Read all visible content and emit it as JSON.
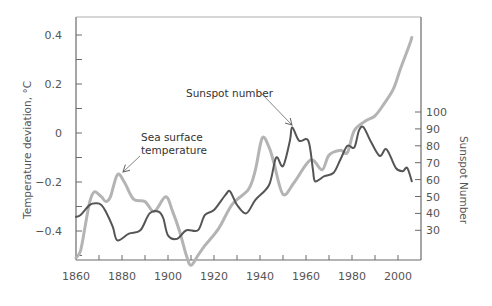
{
  "chart_data": {
    "type": "line",
    "title": "",
    "xlabel": "",
    "ylabel": "Temperature deviation, °C",
    "y2label": "Sunspot Number",
    "xlim": [
      1860,
      2010
    ],
    "ylim": [
      -0.52,
      0.46
    ],
    "y2lim": [
      17,
      123
    ],
    "x_ticks": [
      1860,
      1880,
      1900,
      1920,
      1940,
      1960,
      1980,
      2000
    ],
    "x_minor_ticks": [
      1870,
      1890,
      1910,
      1930,
      1950,
      1970,
      1990
    ],
    "y_ticks": [
      {
        "value": 0.4,
        "label": "0.4"
      },
      {
        "value": 0.2,
        "label": "0.2"
      },
      {
        "value": 0,
        "label": "0"
      },
      {
        "value": -0.2,
        "label": "-0.2"
      },
      {
        "value": -0.4,
        "label": "-0.4"
      }
    ],
    "y_minor_ticks": [
      0.3,
      0.1,
      -0.1,
      -0.3,
      -0.5
    ],
    "y2_ticks": [
      100,
      90,
      80,
      70,
      60,
      50,
      40,
      30
    ],
    "grid": false,
    "legend": "annotations",
    "series": [
      {
        "name": "Sea surface temperature",
        "axis": "left",
        "color": "#b4b4b4",
        "width": 3,
        "x": [
          1860,
          1862,
          1864,
          1866,
          1868,
          1871,
          1873,
          1875,
          1878,
          1881,
          1885,
          1890,
          1894,
          1899,
          1902,
          1905,
          1908,
          1910,
          1913,
          1916,
          1922,
          1928,
          1935,
          1938,
          1941,
          1944,
          1946,
          1950,
          1955,
          1962,
          1967,
          1970,
          1975,
          1978,
          1981,
          1986,
          1990,
          1994,
          1998,
          2001,
          2005,
          2006
        ],
        "values": [
          -0.51,
          -0.48,
          -0.38,
          -0.28,
          -0.24,
          -0.26,
          -0.28,
          -0.26,
          -0.17,
          -0.2,
          -0.27,
          -0.28,
          -0.32,
          -0.26,
          -0.32,
          -0.4,
          -0.5,
          -0.54,
          -0.5,
          -0.46,
          -0.39,
          -0.29,
          -0.23,
          -0.15,
          -0.02,
          -0.06,
          -0.12,
          -0.25,
          -0.2,
          -0.11,
          -0.15,
          -0.09,
          -0.07,
          -0.08,
          0.01,
          0.05,
          0.07,
          0.12,
          0.18,
          0.26,
          0.36,
          0.39
        ]
      },
      {
        "name": "Sunspot number",
        "axis": "right",
        "color": "#555555",
        "width": 2,
        "x": [
          1860,
          1862,
          1866,
          1869,
          1871,
          1873,
          1876,
          1878,
          1883,
          1888,
          1892,
          1896,
          1898,
          1900,
          1904,
          1908,
          1913,
          1916,
          1920,
          1925,
          1927,
          1930,
          1934,
          1938,
          1944,
          1947,
          1950,
          1953,
          1954,
          1957,
          1961,
          1963,
          1964,
          1968,
          1972,
          1975,
          1978,
          1981,
          1983,
          1985,
          1988,
          1992,
          1995,
          1999,
          2002,
          2004,
          2006
        ],
        "values": [
          38,
          39,
          45,
          46,
          45,
          41,
          32,
          24,
          28,
          30,
          40,
          41,
          37,
          27,
          25,
          30,
          30,
          39,
          42,
          51,
          53,
          45,
          40,
          48,
          57,
          73,
          68,
          83,
          91,
          83,
          83,
          66,
          59,
          62,
          64,
          72,
          80,
          79,
          89,
          91,
          83,
          74,
          78,
          67,
          65,
          67,
          59
        ]
      }
    ],
    "annotations": [
      {
        "lines": [
          "Sea surface",
          "temperature"
        ],
        "text_x": 140,
        "text_y": 140,
        "arrow_from": [
          143,
          153
        ],
        "arrow_to": [
          122,
          172
        ]
      },
      {
        "lines": [
          "Sunspot number"
        ],
        "text_x": 186,
        "text_y": 97,
        "arrow_from": [
          261,
          92
        ],
        "arrow_to": [
          292,
          125
        ]
      }
    ]
  },
  "labels": {
    "y_axis_title": "Temperature deviation, °C",
    "y2_axis_title": "Sunspot Number",
    "annotation_sst_line1": "Sea surface",
    "annotation_sst_line2": "temperature",
    "annotation_sunspot": "Sunspot number"
  }
}
